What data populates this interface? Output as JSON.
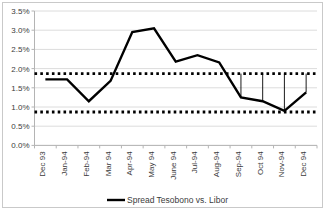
{
  "chart_data": {
    "type": "line",
    "title": "",
    "xlabel": "",
    "ylabel": "",
    "grid": true,
    "ylim": [
      0.0,
      3.5
    ],
    "ytick_step": 0.5,
    "ytick_labels": [
      "0.0%",
      "0.5%",
      "1.0%",
      "1.5%",
      "2.0%",
      "2.5%",
      "3.0%",
      "3.5%"
    ],
    "categories": [
      "Dec 93",
      "Jan-94",
      "Feb-94",
      "Mar 94",
      "Apr-94",
      "May 94",
      "June 94",
      "Jul-94",
      "Aug-94",
      "Sep-94",
      "Oct 94",
      "Nov-94",
      "Dec 94"
    ],
    "series": [
      {
        "name": "Spread Tesobono vs. Libor",
        "color": "#000000",
        "values": [
          1.72,
          1.72,
          1.15,
          1.68,
          2.95,
          3.05,
          2.18,
          2.35,
          2.16,
          1.25,
          1.15,
          0.9,
          1.38
        ]
      }
    ],
    "reference_lines": [
      {
        "name": "upper-band-line",
        "value": 1.87,
        "style": "dotted",
        "color": "#000000"
      },
      {
        "name": "lower-band-line",
        "value": 0.87,
        "style": "dotted",
        "color": "#000000"
      }
    ],
    "droplines": {
      "from_value": 1.87,
      "categories": [
        "Sep-94",
        "Oct 94",
        "Nov-94",
        "Dec 94"
      ],
      "color": "#000000"
    },
    "legend": {
      "position": "bottom",
      "entries": [
        {
          "label": "Spread Tesobono vs. Libor",
          "color": "#000000"
        }
      ]
    }
  },
  "colors": {
    "frame_border": "#c9c9c9",
    "gridline": "#dcdcdc",
    "axis": "#b4b4b4",
    "text": "#3b3b3b",
    "plot_background": "#ffffff"
  },
  "legend_text": "Spread Tesobono vs. Libor"
}
